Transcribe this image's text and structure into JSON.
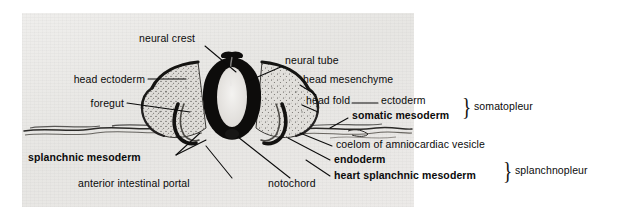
{
  "figure": {
    "plate": {
      "background_color": "#e9e8e6",
      "left": 22,
      "top": 13,
      "width": 392,
      "height": 194
    },
    "ink_color": "#0b0b0b"
  },
  "labels": {
    "neural_crest": "neural crest",
    "neural_tube": "neural tube",
    "head_ectoderm": "head ectoderm",
    "head_mesenchyme": "head mesenchyme",
    "foregut": "foregut",
    "head_fold": "head fold",
    "ectoderm": "ectoderm",
    "somatic_mesoderm": "somatic mesoderm",
    "coelom": "coelom of amniocardiac vesicle",
    "endoderm": "endoderm",
    "heart_splanchnic_mesoderm": "heart splanchnic mesoderm",
    "splanchnic_mesoderm": "splanchnic mesoderm",
    "anterior_intestinal_portal": "anterior intestinal portal",
    "notochord": "notochord",
    "somatopleur": "somatopleur",
    "splanchnopleur": "splanchnopleur"
  },
  "brackets": {
    "somatopleur_brace": "}",
    "splanchnopleur_brace": "}"
  },
  "structures": {
    "neural_tube_lumen": "neural-tube-lumen",
    "neural_tube_wall": "neural-tube-wall",
    "left_head_fold": "left-head-fold-mesenchyme",
    "right_head_fold": "right-head-fold-mesenchyme",
    "left_foregut_pocket": "left-foregut-pocket",
    "right_foregut_pocket": "right-foregut-pocket",
    "left_membrane": "left-extraembryonic-membrane",
    "right_membrane": "right-extraembryonic-membrane",
    "notochord_body": "notochord-body"
  }
}
